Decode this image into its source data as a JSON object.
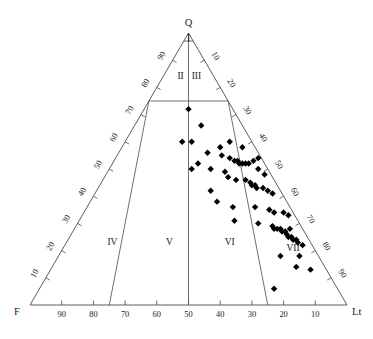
{
  "figure": {
    "type": "ternary-scatter",
    "title": ""
  },
  "chart_data": {
    "type": "scatter",
    "title": "",
    "subtitle": "",
    "plot_style": "ternary",
    "xlabel": "",
    "ylabel": "",
    "grid": false,
    "legend": "none",
    "axes": {
      "top_vertex": {
        "label": "Q",
        "name": "Quartz"
      },
      "left_vertex": {
        "label": "F",
        "name": "Feldspar"
      },
      "right_vertex": {
        "label": "Lt",
        "name": "Total lithic fragments"
      },
      "ticks": [
        10,
        20,
        30,
        40,
        50,
        60,
        70,
        80,
        90
      ],
      "bottom_tick_labels": [
        "90",
        "80",
        "70",
        "60",
        "50",
        "40",
        "30",
        "20",
        "10"
      ],
      "left_tick_labels": [
        "10",
        "20",
        "30",
        "40",
        "50",
        "60",
        "70",
        "80",
        "90"
      ],
      "right_tick_labels": [
        "10",
        "20",
        "30",
        "40",
        "50",
        "60",
        "70",
        "80",
        "90"
      ],
      "range": [
        0,
        100
      ]
    },
    "fields": [
      {
        "label": "I",
        "q": 97,
        "f": 1.5,
        "lt": 1.5
      },
      {
        "label": "II",
        "q": 83,
        "f": 11,
        "lt": 6
      },
      {
        "label": "III",
        "q": 83,
        "f": 6,
        "lt": 11
      },
      {
        "label": "IV",
        "q": 22,
        "f": 63,
        "lt": 15
      },
      {
        "label": "V",
        "q": 22,
        "f": 45,
        "lt": 33
      },
      {
        "label": "VI",
        "q": 22,
        "f": 26,
        "lt": 52
      },
      {
        "label": "VII",
        "q": 20,
        "f": 7,
        "lt": 73
      }
    ],
    "series": [
      {
        "name": "samples",
        "marker": "diamond",
        "color": "#000000",
        "points": [
          {
            "q": 72,
            "f": 14,
            "lt": 14
          },
          {
            "q": 66,
            "f": 13,
            "lt": 21
          },
          {
            "q": 60,
            "f": 22,
            "lt": 18
          },
          {
            "q": 60,
            "f": 19,
            "lt": 21
          },
          {
            "q": 58,
            "f": 11,
            "lt": 31
          },
          {
            "q": 60,
            "f": 7,
            "lt": 33
          },
          {
            "q": 58,
            "f": 4,
            "lt": 38
          },
          {
            "q": 56,
            "f": 16,
            "lt": 28
          },
          {
            "q": 55,
            "f": 12,
            "lt": 33
          },
          {
            "q": 54,
            "f": 10,
            "lt": 36
          },
          {
            "q": 53,
            "f": 9,
            "lt": 38
          },
          {
            "q": 53,
            "f": 8,
            "lt": 39
          },
          {
            "q": 52,
            "f": 8,
            "lt": 40
          },
          {
            "q": 52,
            "f": 7,
            "lt": 41
          },
          {
            "q": 52,
            "f": 6,
            "lt": 42
          },
          {
            "q": 52,
            "f": 5,
            "lt": 43
          },
          {
            "q": 53,
            "f": 3,
            "lt": 44
          },
          {
            "q": 54,
            "f": 1,
            "lt": 45
          },
          {
            "q": 52,
            "f": 21,
            "lt": 27
          },
          {
            "q": 50,
            "f": 24,
            "lt": 26
          },
          {
            "q": 50,
            "f": 18,
            "lt": 32
          },
          {
            "q": 49,
            "f": 14,
            "lt": 37
          },
          {
            "q": 50,
            "f": 3,
            "lt": 47
          },
          {
            "q": 48,
            "f": 2,
            "lt": 50
          },
          {
            "q": 47,
            "f": 14,
            "lt": 39
          },
          {
            "q": 46,
            "f": 12,
            "lt": 42
          },
          {
            "q": 46,
            "f": 9,
            "lt": 45
          },
          {
            "q": 45,
            "f": 8,
            "lt": 47
          },
          {
            "q": 44,
            "f": 8,
            "lt": 48
          },
          {
            "q": 44,
            "f": 7,
            "lt": 49
          },
          {
            "q": 43,
            "f": 7,
            "lt": 50
          },
          {
            "q": 43,
            "f": 5,
            "lt": 52
          },
          {
            "q": 42,
            "f": 22,
            "lt": 36
          },
          {
            "q": 42,
            "f": 4,
            "lt": 54
          },
          {
            "q": 41,
            "f": 3,
            "lt": 56
          },
          {
            "q": 38,
            "f": 22,
            "lt": 40
          },
          {
            "q": 36,
            "f": 18,
            "lt": 46
          },
          {
            "q": 36,
            "f": 11,
            "lt": 53
          },
          {
            "q": 35,
            "f": 7,
            "lt": 58
          },
          {
            "q": 34,
            "f": 6,
            "lt": 60
          },
          {
            "q": 34,
            "f": 3,
            "lt": 63
          },
          {
            "q": 33,
            "f": 2,
            "lt": 65
          },
          {
            "q": 31,
            "f": 20,
            "lt": 49
          },
          {
            "q": 30,
            "f": 13,
            "lt": 57
          },
          {
            "q": 29,
            "f": 9,
            "lt": 62
          },
          {
            "q": 28,
            "f": 9,
            "lt": 63
          },
          {
            "q": 28,
            "f": 8,
            "lt": 64
          },
          {
            "q": 28,
            "f": 7,
            "lt": 65
          },
          {
            "q": 27,
            "f": 7,
            "lt": 66
          },
          {
            "q": 27,
            "f": 6,
            "lt": 67
          },
          {
            "q": 28,
            "f": 4,
            "lt": 68
          },
          {
            "q": 26,
            "f": 6,
            "lt": 68
          },
          {
            "q": 25,
            "f": 6,
            "lt": 69
          },
          {
            "q": 25,
            "f": 5,
            "lt": 70
          },
          {
            "q": 24,
            "f": 5,
            "lt": 71
          },
          {
            "q": 24,
            "f": 4,
            "lt": 72
          },
          {
            "q": 23,
            "f": 4,
            "lt": 73
          },
          {
            "q": 22,
            "f": 3,
            "lt": 75
          },
          {
            "q": 18,
            "f": 12,
            "lt": 70
          },
          {
            "q": 18,
            "f": 6,
            "lt": 76
          },
          {
            "q": 14,
            "f": 9,
            "lt": 77
          },
          {
            "q": 13,
            "f": 5,
            "lt": 82
          },
          {
            "q": 6,
            "f": 20,
            "lt": 74
          }
        ]
      }
    ]
  }
}
